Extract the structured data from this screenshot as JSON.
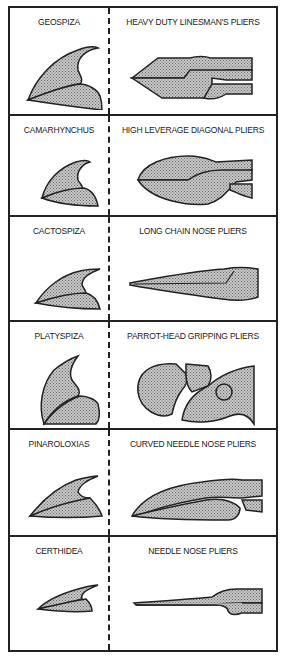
{
  "figure": {
    "type": "comparison-table",
    "columns": [
      "Finch genus (beak)",
      "Plier type"
    ],
    "colors": {
      "stroke": "#222222",
      "fill_stipple": "#b0b0b0",
      "background": "#ffffff"
    }
  },
  "rows": [
    {
      "bird": "GEOSPIZA",
      "tool": "HEAVY DUTY LINESMAN'S PLIERS"
    },
    {
      "bird": "CAMARHYNCHUS",
      "tool": "HIGH LEVERAGE DIAGONAL PLIERS"
    },
    {
      "bird": "CACTOSPIZA",
      "tool": "LONG CHAIN NOSE PLIERS"
    },
    {
      "bird": "PLATYSPIZA",
      "tool": "PARROT-HEAD GRIPPING PLIERS"
    },
    {
      "bird": "PINAROLOXIAS",
      "tool": "CURVED NEEDLE NOSE PLIERS"
    },
    {
      "bird": "CERTHIDEA",
      "tool": "NEEDLE NOSE PLIERS"
    }
  ]
}
